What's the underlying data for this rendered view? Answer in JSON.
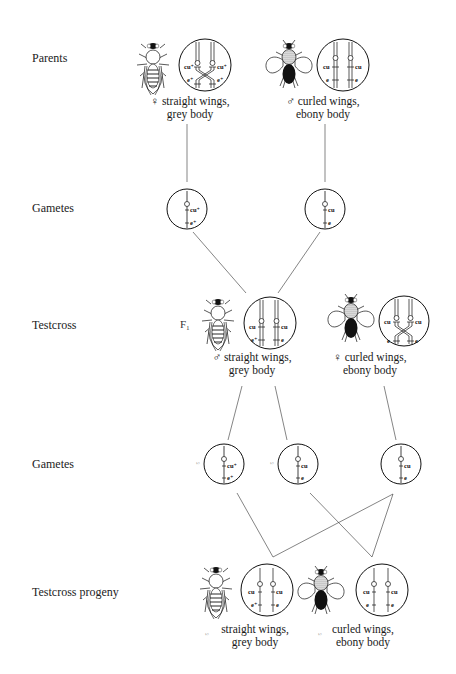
{
  "diagram": {
    "type": "genetic-cross",
    "rows": [
      {
        "id": "parents",
        "label": "Parents"
      },
      {
        "id": "gametes1",
        "label": "Gametes"
      },
      {
        "id": "testcross",
        "label": "Testcross"
      },
      {
        "id": "gametes2",
        "label": "Gametes"
      },
      {
        "id": "progeny",
        "label": "Testcross progeny"
      }
    ],
    "generation_marker": "F₁",
    "parents": [
      {
        "sex_symbol": "♀",
        "line1": "♀ straight wings,",
        "line2": "grey body",
        "body": "grey",
        "wings": "straight",
        "genotype": {
          "chrom1": [
            "cu⁺",
            "e⁺"
          ],
          "chrom2": [
            "cu⁺",
            "e⁺"
          ]
        }
      },
      {
        "sex_symbol": "♂",
        "line1": "♂ curled wings,",
        "line2": "ebony body",
        "body": "ebony",
        "wings": "curled",
        "genotype": {
          "chrom1": [
            "cu",
            "e"
          ],
          "chrom2": [
            "cu",
            "e"
          ]
        }
      }
    ],
    "gametes1": [
      {
        "alleles": [
          "cu⁺",
          "e⁺"
        ]
      },
      {
        "alleles": [
          "cu",
          "e"
        ]
      }
    ],
    "testcross": [
      {
        "line1": "♂ straight wings,",
        "line2": "grey body",
        "genotype": {
          "chrom1": [
            "cu⁺",
            "e⁺"
          ],
          "chrom2": [
            "cu",
            "e"
          ]
        }
      },
      {
        "line1": "♀ curled wings,",
        "line2": "ebony body",
        "genotype": {
          "chrom1": [
            "cu",
            "e"
          ],
          "chrom2": [
            "cu",
            "e"
          ]
        }
      }
    ],
    "gametes2": [
      {
        "fraction": "½",
        "alleles": [
          "cu⁺",
          "e⁺"
        ]
      },
      {
        "fraction": "½",
        "alleles": [
          "cu",
          "e"
        ]
      },
      {
        "fraction": "",
        "alleles": [
          "cu",
          "e"
        ]
      }
    ],
    "progeny": [
      {
        "fraction": "½",
        "line1": "straight wings,",
        "line2": "grey body",
        "genotype": {
          "chrom1": [
            "cu⁺",
            "e⁺"
          ],
          "chrom2": [
            "cu",
            "e"
          ]
        }
      },
      {
        "fraction": "½",
        "line1": "curled wings,",
        "line2": "ebony body",
        "genotype": {
          "chrom1": [
            "cu",
            "e"
          ],
          "chrom2": [
            "cu",
            "e"
          ]
        }
      }
    ]
  },
  "colors": {
    "ink": "#1a1a1a",
    "background": "#ffffff",
    "ebony": "#111111",
    "grey_stipple": "#8a8a8a"
  }
}
